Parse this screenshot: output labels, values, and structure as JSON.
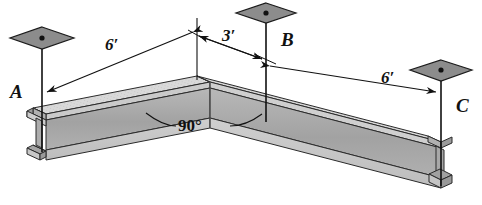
{
  "figure": {
    "kind": "engineering-free-body-diagram",
    "labels": {
      "support_a": "A",
      "support_b": "B",
      "support_c": "C"
    },
    "dimensions": {
      "left_span": "6′",
      "mid_span": "3′",
      "right_span": "6′"
    },
    "angle": {
      "bend": "90°"
    },
    "colors": {
      "line": "#111111",
      "anchor_plate_fill": "#8c8c8c",
      "beam_top_flange": "#d8d8d8",
      "beam_web_shade": "#a9a9a9",
      "beam_bottom_flange": "#c4c4c4",
      "beam_dark_edge": "#8f8f8f",
      "background": "#ffffff"
    },
    "parts": {
      "anchor_plate_a": "anchor-plate-a",
      "anchor_plate_b": "anchor-plate-b",
      "anchor_plate_c": "anchor-plate-c",
      "cable_a": "cable-a",
      "cable_b": "cable-b",
      "cable_c": "cable-c",
      "beam_left_segment": "beam-left-segment",
      "beam_right_segment": "beam-right-segment",
      "beam_apex": "beam-apex-bend"
    }
  }
}
